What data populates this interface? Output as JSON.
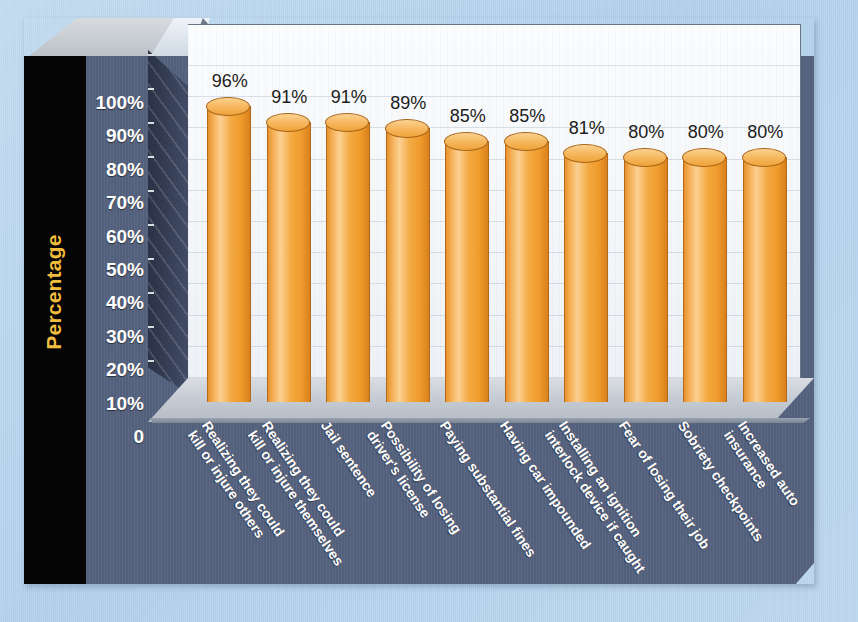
{
  "chart_data": {
    "type": "bar",
    "title": "",
    "xlabel": "",
    "ylabel": "Percentage",
    "ylim": [
      0,
      100
    ],
    "grid": true,
    "legend": "none",
    "value_suffix": "%",
    "categories": [
      "Realizing they could kill or injure others",
      "Realizing they could kill or injure themselves",
      "Jail sentence",
      "Possibility of losing driver's license",
      "Paying substantial fines",
      "Having car impounded",
      "Installing an ignition interlock device if caught",
      "Fear of losing their job",
      "Sobriety checkpoints",
      "Increased auto insurance"
    ],
    "category_lines": [
      [
        "Realizing they could",
        "kill or injure others"
      ],
      [
        "Realizing they could",
        "kill or injure themselves"
      ],
      [
        "Jail sentence"
      ],
      [
        "Possibility of losing",
        "driver's license"
      ],
      [
        "Paying substantial fines"
      ],
      [
        "Having car impounded"
      ],
      [
        "Installing an ignition",
        "interlock device if caught"
      ],
      [
        "Fear of losing their job"
      ],
      [
        "Sobriety checkpoints"
      ],
      [
        "Increased auto",
        "insurance"
      ]
    ],
    "values": [
      96,
      91,
      91,
      89,
      85,
      85,
      81,
      80,
      80,
      80
    ],
    "value_labels": [
      "96%",
      "91%",
      "91%",
      "89%",
      "85%",
      "85%",
      "81%",
      "80%",
      "80%",
      "80%"
    ],
    "yticks": [
      100,
      90,
      80,
      70,
      60,
      50,
      40,
      30,
      20,
      10,
      0
    ],
    "ytick_labels": [
      "100%",
      "90%",
      "80%",
      "70%",
      "60%",
      "50%",
      "40%",
      "30%",
      "20%",
      "10%",
      "0"
    ]
  },
  "colors": {
    "background": "#b9d6ee",
    "panel_slate": "#56637f",
    "axis_title": "#f2bd3d",
    "bar_orange": "#f3a941",
    "bar_orange_light": "#fbd092",
    "bar_orange_dark": "#d9811c",
    "plot_background": "#f7f9fb",
    "floor": "#c3c9d1",
    "side_wall": "#39425a",
    "label_text": "#ffffff",
    "value_text": "#1c1d20",
    "black_slab": "#050506"
  }
}
